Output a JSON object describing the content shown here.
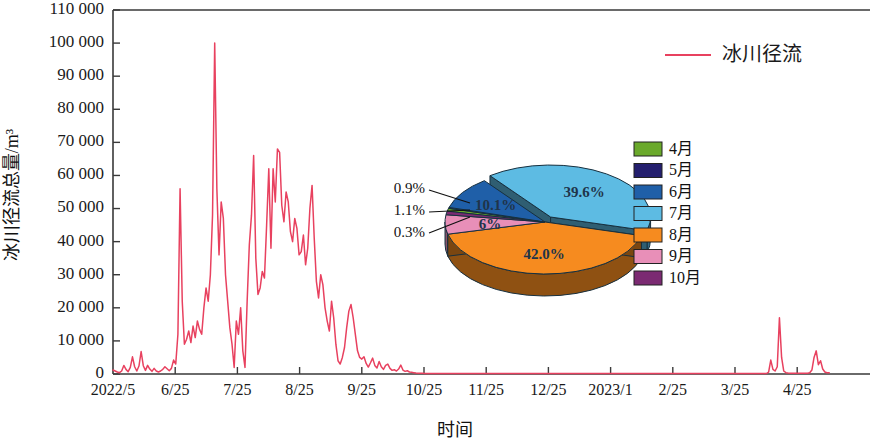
{
  "chart_data": {
    "type": "line",
    "title": "",
    "xlabel": "时间",
    "ylabel": "冰川径流总量/m³",
    "ylim": [
      0,
      110000
    ],
    "grid": false,
    "legend_position": "top-right",
    "y_ticks": [
      "0",
      "10 000",
      "20 000",
      "30 000",
      "40 000",
      "50 000",
      "60 000",
      "70 000",
      "80 000",
      "90 000",
      "100 000",
      "110 000"
    ],
    "y_tick_values": [
      0,
      10000,
      20000,
      30000,
      40000,
      50000,
      60000,
      70000,
      80000,
      90000,
      100000,
      110000
    ],
    "x_ticks": [
      "2022/5",
      "6/25",
      "7/25",
      "8/25",
      "9/25",
      "10/25",
      "11/25",
      "12/25",
      "2023/1",
      "2/25",
      "3/25",
      "4/25"
    ],
    "series": [
      {
        "name": "冰川径流",
        "color": "#e8415f",
        "values": [
          1200,
          900,
          600,
          400,
          900,
          2600,
          1400,
          700,
          2000,
          5200,
          2200,
          900,
          2400,
          6800,
          2500,
          1100,
          2600,
          1500,
          800,
          1700,
          900,
          600,
          900,
          1400,
          2200,
          1600,
          1000,
          1700,
          4200,
          3000,
          12000,
          56000,
          22000,
          9000,
          10500,
          13000,
          9500,
          14500,
          11000,
          16000,
          13500,
          12000,
          20000,
          26000,
          22000,
          30000,
          48000,
          100000,
          56000,
          36000,
          52000,
          47000,
          30000,
          22000,
          14000,
          9000,
          2000,
          16000,
          12000,
          20000,
          7000,
          2000,
          22000,
          39000,
          48000,
          66000,
          35000,
          24000,
          26000,
          31000,
          29000,
          45000,
          62000,
          38000,
          62000,
          52000,
          68000,
          67000,
          51000,
          46000,
          55000,
          52000,
          43000,
          40000,
          47000,
          44000,
          36000,
          37000,
          42000,
          33000,
          38000,
          50000,
          57000,
          41000,
          28000,
          23000,
          30000,
          27000,
          20000,
          16000,
          13000,
          22000,
          17000,
          9000,
          4000,
          3000,
          5000,
          8000,
          14000,
          19000,
          21000,
          17000,
          12000,
          7000,
          5000,
          4500,
          5200,
          3200,
          2100,
          3400,
          4800,
          2600,
          1800,
          3800,
          2200,
          1400,
          2600,
          3000,
          1700,
          1100,
          1300,
          900,
          1500,
          2700,
          1200,
          800,
          1000,
          600,
          500,
          400,
          300,
          250,
          220,
          200,
          180,
          170,
          160,
          160,
          150,
          150,
          150,
          150,
          150,
          150,
          150,
          150,
          150,
          150,
          150,
          150,
          150,
          150,
          150,
          150,
          150,
          150,
          150,
          150,
          150,
          150,
          150,
          150,
          150,
          150,
          150,
          150,
          150,
          150,
          150,
          150,
          150,
          150,
          150,
          150,
          150,
          150,
          150,
          150,
          150,
          150,
          150,
          150,
          150,
          150,
          150,
          150,
          150,
          150,
          150,
          150,
          150,
          150,
          150,
          150,
          150,
          150,
          150,
          150,
          150,
          150,
          150,
          150,
          150,
          150,
          150,
          150,
          150,
          150,
          150,
          150,
          150,
          150,
          150,
          150,
          150,
          150,
          150,
          150,
          150,
          150,
          150,
          150,
          150,
          150,
          150,
          150,
          150,
          150,
          150,
          150,
          150,
          150,
          150,
          150,
          150,
          150,
          150,
          150,
          150,
          150,
          150,
          150,
          150,
          150,
          150,
          150,
          150,
          150,
          150,
          150,
          150,
          150,
          150,
          150,
          150,
          150,
          150,
          150,
          150,
          150,
          150,
          150,
          150,
          150,
          150,
          150,
          150,
          150,
          150,
          150,
          150,
          150,
          150,
          150,
          150,
          150,
          150,
          150,
          150,
          150,
          150,
          150,
          150,
          150,
          150,
          150,
          150,
          150,
          150,
          150,
          150,
          150,
          150,
          600,
          4200,
          1400,
          900,
          2200,
          17000,
          5000,
          900,
          400,
          300,
          250,
          220,
          200,
          200,
          200,
          200,
          200,
          200,
          250,
          400,
          1200,
          5000,
          7000,
          2800,
          4000,
          1500,
          600,
          400,
          350
        ]
      }
    ],
    "legend": [
      {
        "label": "冰川径流",
        "color": "#e8415f"
      }
    ],
    "inset_pie": {
      "type": "pie",
      "slices": [
        {
          "label": "4月",
          "value": 0.9,
          "display": "0.9%",
          "color": "#6aa92b",
          "callout": true
        },
        {
          "label": "5月",
          "value": 0.3,
          "display": "0.3%",
          "color": "#241f6e",
          "callout": true
        },
        {
          "label": "6月",
          "value": 10.1,
          "display": "10.1%",
          "color": "#1f5fa8",
          "callout": false
        },
        {
          "label": "7月",
          "value": 39.6,
          "display": "39.6%",
          "color": "#5dbbe3",
          "callout": false
        },
        {
          "label": "8月",
          "value": 42.0,
          "display": "42.0%",
          "color": "#f68b1f",
          "callout": false
        },
        {
          "label": "9月",
          "value": 6.0,
          "display": "6%",
          "color": "#e88fb8",
          "callout": false
        },
        {
          "label": "10月",
          "value": 1.1,
          "display": "1.1%",
          "color": "#7b2a72",
          "callout": true
        }
      ],
      "legend_items": [
        {
          "label": "4月",
          "color": "#6aa92b"
        },
        {
          "label": "5月",
          "color": "#241f6e"
        },
        {
          "label": "6月",
          "color": "#1f5fa8"
        },
        {
          "label": "7月",
          "color": "#5dbbe3"
        },
        {
          "label": "8月",
          "color": "#f68b1f"
        },
        {
          "label": "9月",
          "color": "#e88fb8"
        },
        {
          "label": "10月",
          "color": "#7b2a72"
        }
      ],
      "callouts": [
        {
          "display": "0.9%"
        },
        {
          "display": "1.1%"
        },
        {
          "display": "0.3%"
        }
      ]
    }
  }
}
